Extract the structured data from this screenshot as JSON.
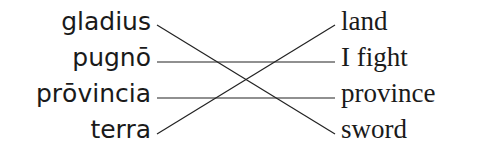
{
  "diagram": {
    "type": "matching",
    "left_terms": [
      "gladius",
      "pugnō",
      "prōvincia",
      "terra"
    ],
    "right_terms": [
      "land",
      "I fight",
      "province",
      "sword"
    ],
    "connections": [
      {
        "from": "gladius",
        "to": "sword"
      },
      {
        "from": "pugnō",
        "to": "I fight"
      },
      {
        "from": "prōvincia",
        "to": "province"
      },
      {
        "from": "terra",
        "to": "land"
      }
    ],
    "line_color": "#222222"
  }
}
